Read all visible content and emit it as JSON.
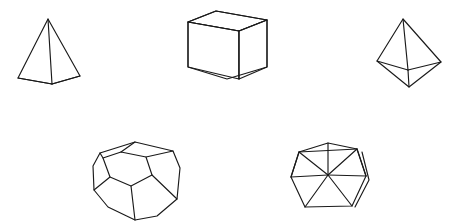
{
  "figure": {
    "background_color": "#ffffff",
    "stroke_color": "#1a1a1a",
    "fill_color": "#ffffff",
    "stroke_width": 1.15,
    "canvas": {
      "width": 453,
      "height": 224
    },
    "shape_count": 5,
    "row_layout": [
      3,
      2
    ]
  },
  "chart_data": {
    "type": "diagram",
    "xlabel": "",
    "ylabel": "",
    "categories": [
      "tetrahedron",
      "hexahedron (cube)",
      "octahedron",
      "dodecahedron",
      "icosahedron"
    ],
    "values": [
      4,
      6,
      8,
      12,
      20
    ],
    "series": [
      {
        "name": "faces",
        "values": [
          4,
          6,
          8,
          12,
          20
        ]
      },
      {
        "name": "vertices",
        "values": [
          4,
          8,
          6,
          20,
          12
        ]
      },
      {
        "name": "edges",
        "values": [
          6,
          12,
          12,
          30,
          30
        ]
      }
    ],
    "legend_position": "none",
    "grid": false
  },
  "solids": [
    {
      "name": "tetrahedron",
      "label": "Tetrahedron",
      "position": "top-left",
      "faces": 4,
      "vertices": 4,
      "edges": 6,
      "face_shape": "triangle",
      "outline": "18,78 48,19 80,76 52,84",
      "inner_edges": [
        "48,19 52,84",
        "18,78 52,84",
        "52,84 80,76"
      ]
    },
    {
      "name": "hexahedron",
      "label": "Cube",
      "position": "top-center",
      "faces": 6,
      "vertices": 8,
      "edges": 12,
      "face_shape": "square",
      "outline": "188,22 216,11 267,20 267,67 227,79 188,67",
      "inner_edges": [
        "188,22 239,31 267,20",
        "239,31 239,79",
        "239,79 227,79"
      ],
      "top_face": "188,22 216,11 267,20 239,31",
      "left_face": "188,22 239,31 239,79 188,67",
      "right_face": "239,31 267,20 267,67 239,79"
    },
    {
      "name": "octahedron",
      "label": "Octahedron",
      "position": "top-right",
      "faces": 8,
      "vertices": 6,
      "edges": 12,
      "face_shape": "triangle",
      "outline": "377,61 403,19 441,62 409,87",
      "inner_edges": [
        "403,19 408,70",
        "377,61 408,70",
        "408,70 441,62",
        "408,70 409,87"
      ]
    },
    {
      "name": "dodecahedron",
      "label": "Dodecahedron",
      "position": "bottom-left",
      "faces": 12,
      "vertices": 20,
      "edges": 30,
      "face_shape": "pentagon",
      "outline": "100,153 135,142 173,151 180,168 177,199 157,216 135,220 108,207 94,190 93,166",
      "inner_edges": [
        "103,158 121,152 146,157 152,175 131,186 110,177",
        "121,152 135,142",
        "146,157 173,151",
        "152,175 177,199",
        "131,186 135,220",
        "110,177 94,190",
        "103,158 100,153"
      ],
      "front_face": "103,158 121,152 146,157 152,175 131,186 110,177"
    },
    {
      "name": "icosahedron",
      "label": "Icosahedron",
      "position": "bottom-right",
      "faces": 20,
      "vertices": 12,
      "edges": 30,
      "face_shape": "triangle",
      "outline": "291,177 299,152 328,143 357,149 366,176 352,206 305,207",
      "inner_edges": [
        "328,143 328,175",
        "291,177 328,175",
        "328,175 366,176",
        "328,175 305,207",
        "328,175 352,206",
        "299,152 328,175",
        "357,149 328,175",
        "299,152 357,149",
        "291,177 299,152",
        "357,149 366,176",
        "362,152 369,180 355,207"
      ]
    }
  ]
}
